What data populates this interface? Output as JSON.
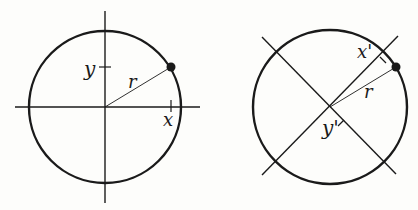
{
  "figures": [
    {
      "name": "standard-axes",
      "labels": {
        "x": "x",
        "y": "y",
        "r": "r"
      },
      "center": [
        105,
        107
      ],
      "radius": 76,
      "point": [
        171,
        67
      ]
    },
    {
      "name": "rotated-axes",
      "labels": {
        "x": "x'",
        "y": "y'",
        "r": "r"
      },
      "center": [
        330,
        107
      ],
      "radius": 77,
      "point": [
        396,
        67
      ]
    }
  ],
  "colors": {
    "ink": "#1a1a1a",
    "background": "#fdfdfb"
  }
}
